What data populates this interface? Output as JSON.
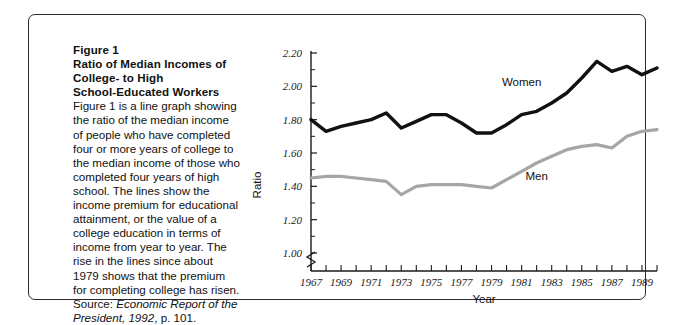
{
  "figure": {
    "heading_lines": [
      "Figure 1",
      "Ratio of Median Incomes of",
      "College- to High",
      "School-Educated Workers"
    ],
    "body_text": "Figure 1 is a line graph showing the ratio of the median income of people who have completed four or more years of college to the median income of those who completed four years of high school. The lines show the income premium for educational attainment, or the value of a college education in terms of income from year to year. The rise in the lines since about 1979 shows that the premium for completing college has risen.",
    "source_prefix": "Source: ",
    "source_italic": "Economic Report of the President, 1992",
    "source_suffix": ", p. 101."
  },
  "chart_data": {
    "type": "line",
    "title": "Ratio of Median Incomes of College- to High School-Educated Workers",
    "xlabel": "Year",
    "ylabel": "Ratio",
    "xlim": [
      1967,
      1990
    ],
    "ylim": [
      1.0,
      2.2
    ],
    "ytick_labels": [
      "2.20",
      "2.00",
      "1.80",
      "1.60",
      "1.40",
      "1.20",
      "1.00"
    ],
    "ytick_values": [
      2.2,
      2.0,
      1.8,
      1.6,
      1.4,
      1.2,
      1.0
    ],
    "xtick_labels": [
      "1967",
      "1969",
      "1971",
      "1973",
      "1975",
      "1977",
      "1979",
      "1981",
      "1983",
      "1985",
      "1987",
      "1989"
    ],
    "xtick_values": [
      1967,
      1969,
      1971,
      1973,
      1975,
      1977,
      1979,
      1981,
      1983,
      1985,
      1987,
      1989
    ],
    "axis_break": true,
    "grid": false,
    "legend_position": "inline-labels",
    "x": [
      1967,
      1968,
      1969,
      1970,
      1971,
      1972,
      1973,
      1974,
      1975,
      1976,
      1977,
      1978,
      1979,
      1980,
      1981,
      1982,
      1983,
      1984,
      1985,
      1986,
      1987,
      1988,
      1989,
      1990
    ],
    "series": [
      {
        "name": "Women",
        "color": "#111111",
        "values": [
          1.8,
          1.73,
          1.76,
          1.78,
          1.8,
          1.84,
          1.75,
          1.79,
          1.83,
          1.83,
          1.78,
          1.72,
          1.72,
          1.77,
          1.83,
          1.85,
          1.9,
          1.96,
          2.05,
          2.15,
          2.09,
          2.12,
          2.07,
          2.11
        ]
      },
      {
        "name": "Men",
        "color": "#a6a6a6",
        "values": [
          1.45,
          1.46,
          1.46,
          1.45,
          1.44,
          1.43,
          1.35,
          1.4,
          1.41,
          1.41,
          1.41,
          1.4,
          1.39,
          1.44,
          1.49,
          1.54,
          1.58,
          1.62,
          1.64,
          1.65,
          1.63,
          1.7,
          1.73,
          1.74
        ]
      }
    ],
    "annotations": [
      {
        "text": "Women",
        "x": 1981,
        "y": 2.0
      },
      {
        "text": "Men",
        "x": 1982,
        "y": 1.44
      }
    ]
  }
}
